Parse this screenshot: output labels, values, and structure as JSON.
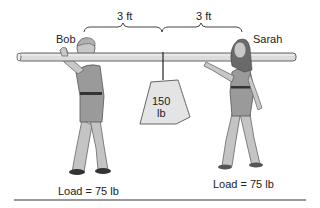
{
  "diagram": {
    "labels": {
      "left_person": "Bob",
      "right_person": "Sarah",
      "left_distance": "3 ft",
      "right_distance": "3 ft",
      "weight_value": "150",
      "weight_unit": "lb",
      "left_load": "Load = 75 lb",
      "right_load": "Load = 75 lb"
    },
    "colors": {
      "pole": "#dcdcdc",
      "outline": "#555555",
      "skin": "#c8c8c8",
      "shirt": "#9a9a9a",
      "pants": "#c4c4c4",
      "hair_bob": "#b0b0b0",
      "hair_sarah": "#6a6a6a",
      "weight_fill": "#e4e4e4",
      "baseline": "#333333"
    }
  }
}
